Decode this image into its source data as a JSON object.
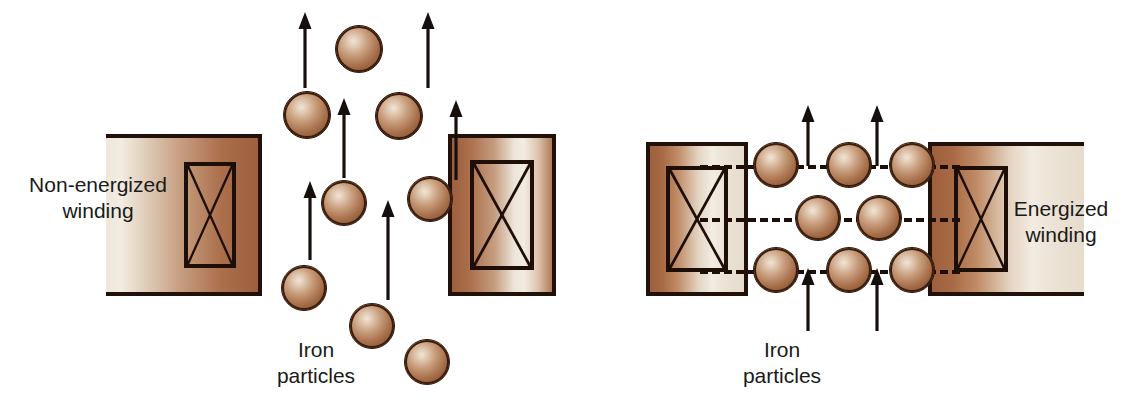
{
  "figure": {
    "background_color": "#ffffff",
    "particle_color": "#a9724e",
    "outline_color": "#1d0e07"
  },
  "left_panel": {
    "label": "Non-energized\nwinding",
    "particles_label": "Iron\nparticles",
    "description": "Iron particles randomly scattered; arrows show random motion, no alignment",
    "winding_left": {
      "x": 106,
      "y": 134,
      "width": 156,
      "height": 162
    },
    "winding_right": {
      "x": 448,
      "y": 134,
      "width": 108,
      "height": 162
    },
    "particles": [
      {
        "x": 335,
        "y": 25,
        "d": 48
      },
      {
        "x": 283,
        "y": 91,
        "d": 48
      },
      {
        "x": 375,
        "y": 92,
        "d": 48
      },
      {
        "x": 321,
        "y": 180,
        "d": 46
      },
      {
        "x": 407,
        "y": 176,
        "d": 46
      },
      {
        "x": 281,
        "y": 265,
        "d": 46
      },
      {
        "x": 349,
        "y": 303,
        "d": 46
      },
      {
        "x": 404,
        "y": 339,
        "d": 46
      }
    ],
    "arrows": [
      {
        "x": 305,
        "y_top": 12,
        "y_bottom": 88
      },
      {
        "x": 428,
        "y_top": 12,
        "y_bottom": 88
      },
      {
        "x": 344,
        "y_top": 98,
        "y_bottom": 178
      },
      {
        "x": 456,
        "y_top": 100,
        "y_bottom": 180
      },
      {
        "x": 310,
        "y_top": 181,
        "y_bottom": 260
      },
      {
        "x": 388,
        "y_top": 200,
        "y_bottom": 300
      }
    ]
  },
  "right_panel": {
    "label": "Energized\nwinding",
    "particles_label": "Iron\nparticles",
    "description": "Iron particles align along magnetic flux lines between the pole pieces",
    "winding_left": {
      "x": 646,
      "y": 142,
      "width": 102,
      "height": 154
    },
    "winding_right": {
      "x": 928,
      "y": 142,
      "width": 156,
      "height": 154
    },
    "flux_lines": [
      {
        "y": 165,
        "x_start": 700,
        "x_end": 960
      },
      {
        "y": 218,
        "x_start": 700,
        "x_end": 960
      },
      {
        "y": 270,
        "x_start": 700,
        "x_end": 960
      }
    ],
    "particle_rows": [
      {
        "y": 165,
        "xs": [
          776,
          849,
          912
        ]
      },
      {
        "y": 218,
        "xs": [
          818,
          879
        ]
      },
      {
        "y": 270,
        "xs": [
          776,
          849,
          912
        ]
      }
    ],
    "particle_diameter": 46,
    "arrows_top": [
      {
        "x": 808,
        "y_top": 105,
        "y_bottom": 166
      },
      {
        "x": 877,
        "y_top": 105,
        "y_bottom": 166
      }
    ],
    "arrows_bottom": [
      {
        "x": 808,
        "y_top": 268,
        "y_bottom": 331
      },
      {
        "x": 877,
        "y_top": 268,
        "y_bottom": 331
      }
    ]
  },
  "labels": {
    "left_winding_label": {
      "x": 8,
      "y": 172,
      "width": 180
    },
    "left_particles_label": {
      "x": 256,
      "y": 337,
      "width": 120
    },
    "right_winding_label": {
      "x": 986,
      "y": 196,
      "width": 150
    },
    "right_particles_label": {
      "x": 722,
      "y": 337,
      "width": 120
    }
  }
}
